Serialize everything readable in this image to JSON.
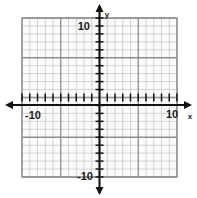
{
  "figure": {
    "kind": "cartesian-coordinate-grid",
    "background_color": "#ffffff"
  },
  "chart_data": {
    "type": "scatter",
    "title": "",
    "subtitle": "",
    "xlabel": "x",
    "ylabel": "y",
    "xlim": [
      -10,
      10
    ],
    "ylim": [
      -10,
      10
    ],
    "grid": true,
    "legend": false,
    "series": [],
    "x": [],
    "values": [],
    "annotations": [],
    "x_tick_labels": [
      "-10",
      "10"
    ],
    "y_tick_labels": [
      "10",
      "-10"
    ],
    "x_tick_label_values": [
      -10,
      10
    ],
    "y_tick_label_values": [
      10,
      -10
    ],
    "minor_tick_step": 1,
    "major_tick_step": 5,
    "x_ticks_all": [
      -10,
      -9,
      -8,
      -7,
      -6,
      -5,
      -4,
      -3,
      -2,
      -1,
      0,
      1,
      2,
      3,
      4,
      5,
      6,
      7,
      8,
      9,
      10
    ],
    "y_ticks_all": [
      -10,
      -9,
      -8,
      -7,
      -6,
      -5,
      -4,
      -3,
      -2,
      -1,
      0,
      1,
      2,
      3,
      4,
      5,
      6,
      7,
      8,
      9,
      10
    ]
  },
  "axes": {
    "x_axis_name": "x",
    "y_axis_name": "y",
    "axis_color": "#111111",
    "arrow_directions": [
      "left",
      "right",
      "up",
      "down"
    ]
  },
  "labels": {
    "x_negative": "-10",
    "x_positive": "10",
    "y_positive": "10",
    "y_negative": "-10"
  },
  "colors": {
    "minor_grid": "#c9c9c9",
    "major_grid": "#8d8d8d",
    "axis": "#111111",
    "text": "#1a1a1a",
    "grid_fill": "#fbfbfb"
  }
}
